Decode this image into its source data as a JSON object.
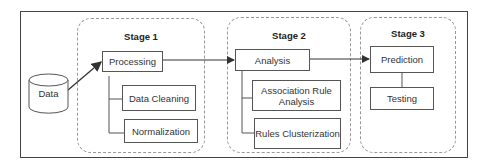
{
  "diagram": {
    "data_source": {
      "label": "Data",
      "shape": "cylinder"
    },
    "stages": [
      {
        "title": "Stage 1",
        "main": "Processing",
        "children": [
          "Data Cleaning",
          "Normalization"
        ]
      },
      {
        "title": "Stage 2",
        "main": "Analysis",
        "children": [
          "Association Rule Analysis",
          "Rules Clusterization"
        ]
      },
      {
        "title": "Stage 3",
        "main": "Prediction",
        "children": [
          "Testing"
        ]
      }
    ],
    "flow": [
      "Data",
      "Processing",
      "Analysis",
      "Prediction"
    ],
    "colors": {
      "line": "#555555",
      "dashed_border": "#999999",
      "frame": "#444444"
    }
  }
}
